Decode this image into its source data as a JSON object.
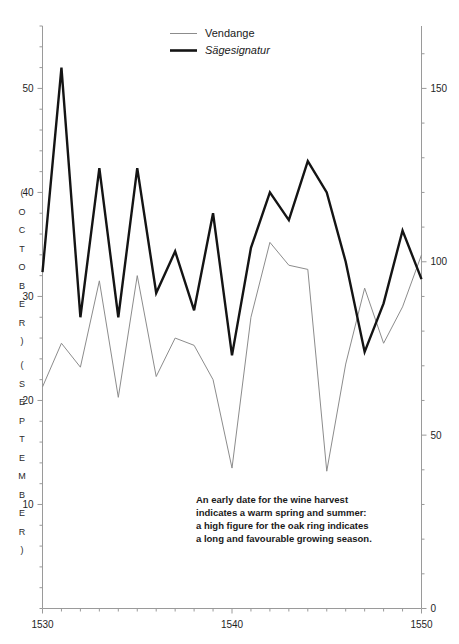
{
  "chart_data": {
    "type": "line",
    "title": "",
    "subtitle": "",
    "xlabel": "",
    "ylabel_left": "( O C T O B E R )  ( S E P T E M B E R )",
    "ylabel_right": "",
    "grid": false,
    "legend_position": "top-center",
    "x": [
      1530,
      1531,
      1532,
      1533,
      1534,
      1535,
      1536,
      1537,
      1538,
      1539,
      1540,
      1541,
      1542,
      1543,
      1544,
      1545,
      1546,
      1547,
      1548,
      1549,
      1550
    ],
    "xlim": [
      1530,
      1550
    ],
    "xticks_major": [
      1530,
      1540,
      1550
    ],
    "xtick_labels": [
      "1530",
      "1540",
      "1550"
    ],
    "xticks_minor_step": 1,
    "left_axis": {
      "ticks": [
        10,
        20,
        30,
        40,
        50
      ],
      "tick_labels": [
        "10",
        "20",
        "30",
        "40",
        "50"
      ],
      "ylim": [
        0,
        56
      ],
      "minor_step": 2,
      "band_labels": [
        "( O C T O B E R )",
        "( S E P T E M B E R )"
      ]
    },
    "right_axis": {
      "ticks": [
        0,
        50,
        100,
        150
      ],
      "tick_labels": [
        "0",
        "50",
        "100",
        "150"
      ],
      "ylim": [
        0,
        168
      ],
      "minor_step": 10
    },
    "series": [
      {
        "name": "Vendange",
        "axis": "left",
        "style": "thin-grey",
        "color": "#8c8c8c",
        "values": [
          21.3,
          25.5,
          23.2,
          31.5,
          20.3,
          32.0,
          22.3,
          26.0,
          25.3,
          22.0,
          13.5,
          28.0,
          35.2,
          33.0,
          32.6,
          13.2,
          23.5,
          30.8,
          25.5,
          29.0,
          34.0
        ]
      },
      {
        "name": "Sägesignatur",
        "axis": "right",
        "style": "thick-black",
        "color": "#141414",
        "values": [
          97,
          156,
          84,
          127,
          84,
          127,
          91,
          103,
          86,
          114,
          73,
          104,
          120,
          112,
          129,
          120,
          100,
          74,
          88,
          109,
          95
        ]
      }
    ],
    "legend": [
      {
        "label": "Vendange",
        "style": "thin-grey",
        "italic": false
      },
      {
        "label": "Sägesignatur",
        "style": "thick-black",
        "italic": true
      }
    ],
    "annotation": {
      "lines": [
        "An early date for the wine harvest",
        "indicates a warm spring and summer:",
        "a high figure for the oak ring indicates",
        "a long and favourable growing season."
      ]
    }
  },
  "legend": {
    "vendange_label": "Vendange",
    "sagesignatur_label": "Sägesignatur"
  },
  "annotation": {
    "line1": "An early date for the wine harvest",
    "line2": "indicates a warm spring and summer:",
    "line3": "a high figure for the oak ring indicates",
    "line4": "a long and favourable growing season."
  },
  "axes": {
    "left_band_october": "( O C T O B E R )",
    "left_band_september": "( S E P T E M B E R )",
    "left_tick_50": "50",
    "left_tick_40": "40",
    "left_tick_30": "30",
    "left_tick_20": "20",
    "left_tick_10": "10",
    "right_tick_150": "150",
    "right_tick_100": "100",
    "right_tick_50": "50",
    "right_tick_0": "0",
    "x_tick_1530": "1530",
    "x_tick_1540": "1540",
    "x_tick_1550": "1550"
  }
}
